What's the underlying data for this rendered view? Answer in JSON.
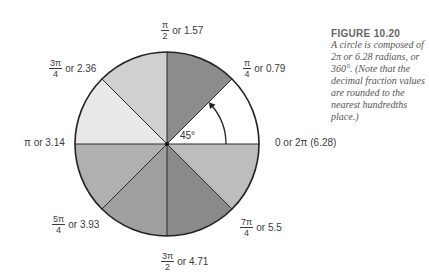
{
  "figure": {
    "title": "FIGURE 10.20",
    "caption": "A circle is composed of 2π or 6.28 radians, or 360°. (Note that the decimal fraction values are rounded to the nearest hundredths place.)"
  },
  "circle": {
    "cx": 167,
    "cy": 144,
    "r": 92,
    "sectors": [
      {
        "start_deg": 0,
        "end_deg": 45,
        "color": "#ffffff"
      },
      {
        "start_deg": 45,
        "end_deg": 90,
        "color": "#8c8c8c"
      },
      {
        "start_deg": 90,
        "end_deg": 135,
        "color": "#d0d0d0"
      },
      {
        "start_deg": 135,
        "end_deg": 180,
        "color": "#e8e8e8"
      },
      {
        "start_deg": 180,
        "end_deg": 225,
        "color": "#b0b0b0"
      },
      {
        "start_deg": 225,
        "end_deg": 270,
        "color": "#a0a0a0"
      },
      {
        "start_deg": 270,
        "end_deg": 315,
        "color": "#8a8a8a"
      },
      {
        "start_deg": 315,
        "end_deg": 360,
        "color": "#bdbdbd"
      }
    ],
    "angle_marker": "45°"
  },
  "labels": {
    "zero": {
      "text": "0 or 2π (6.28)"
    },
    "pi_4": {
      "num": "π",
      "den": "4",
      "text": "or 0.79"
    },
    "pi_2": {
      "num": "π",
      "den": "2",
      "text": "or 1.57"
    },
    "three_pi_4": {
      "num": "3π",
      "den": "4",
      "text": "or 2.36"
    },
    "pi": {
      "text": "π or 3.14"
    },
    "five_pi_4": {
      "num": "5π",
      "den": "4",
      "text": "or 3.93"
    },
    "three_pi_2": {
      "num": "3π",
      "den": "2",
      "text": "or 4.71"
    },
    "seven_pi_4": {
      "num": "7π",
      "den": "4",
      "text": "or 5.5"
    }
  }
}
